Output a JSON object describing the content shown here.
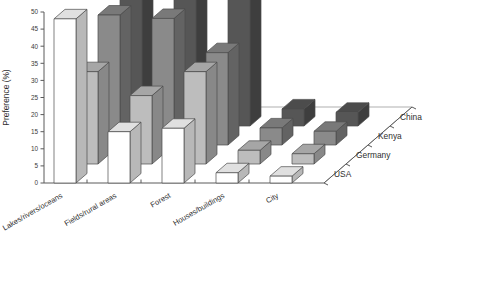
{
  "chart_data": {
    "type": "bar",
    "title": "",
    "subtitle": "",
    "xlabel": "",
    "ylabel": "Preference (%)",
    "ylim": [
      0,
      50
    ],
    "yticks": [
      0,
      5,
      10,
      15,
      20,
      25,
      30,
      35,
      40,
      45,
      50
    ],
    "ytick_labels": [
      "0",
      "5",
      "10",
      "15",
      "20",
      "25",
      "30",
      "35",
      "40",
      "45",
      "50"
    ],
    "grid": false,
    "legend_position": "depth-axis-right",
    "projection": "3d",
    "categories": [
      "Lakes/rivers/oceans",
      "Fields/rural areas",
      "Forest",
      "Houses/buildings",
      "City"
    ],
    "series": [
      {
        "name": "USA",
        "color": "#ffffff",
        "values": [
          48,
          15,
          16,
          3,
          2
        ]
      },
      {
        "name": "Germany",
        "color": "#bdbdbd",
        "values": [
          27,
          20,
          27,
          4,
          3
        ]
      },
      {
        "name": "Kenya",
        "color": "#8a8a8a",
        "values": [
          38,
          37,
          27,
          5,
          4
        ]
      },
      {
        "name": "China",
        "color": "#565656",
        "values": [
          42,
          42,
          42,
          5,
          4
        ]
      }
    ],
    "series_order_front_to_back": [
      "USA",
      "Germany",
      "Kenya",
      "China"
    ],
    "colors": {
      "axis": "#5a5a5a",
      "text": "#2e2e2e",
      "bar_outline": "#4c4c4c",
      "floor": "#8d8d8d",
      "background": "#ffffff"
    }
  },
  "axes": {
    "y_axis_title": "Preference (%)",
    "depth_axis_labels": [
      "China",
      "Kenya",
      "Germany",
      "USA"
    ]
  }
}
